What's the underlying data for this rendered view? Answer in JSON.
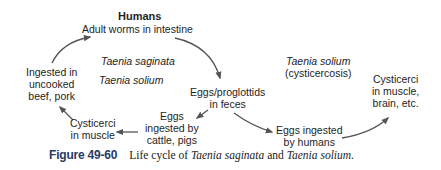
{
  "diagram": {
    "nodes": {
      "humans": {
        "title": "Humans",
        "subtitle": "Adult worms in intestine"
      },
      "species_saginata": "Taenia saginata",
      "species_solium": "Taenia solium",
      "eggs_feces": {
        "line1": "Eggs/proglottids",
        "line2": "in feces"
      },
      "eggs_cattle": {
        "line1": "Eggs",
        "line2": "ingested by",
        "line3": "cattle, pigs"
      },
      "cysticerci_muscle": {
        "line1": "Cysticerci",
        "line2": "in muscle"
      },
      "ingested_uncooked": {
        "line1": "Ingested in",
        "line2": "uncooked",
        "line3": "beef, pork"
      },
      "solium_cysticercosis": {
        "line1": "Taenia solium",
        "line2": "(cysticercosis)"
      },
      "eggs_humans": {
        "line1": "Eggs ingested",
        "line2": "by humans"
      },
      "cysticerci_brain": {
        "line1": "Cysticerci",
        "line2": "in muscle,",
        "line3": "brain, etc."
      }
    },
    "arrow_color": "#555555"
  },
  "caption": {
    "figure_number": "Figure 49-60",
    "text_prefix": "Life cycle of ",
    "species1": "Taenia saginata",
    "conjunction": " and ",
    "species2": "Taenia solium",
    "text_suffix": "."
  }
}
